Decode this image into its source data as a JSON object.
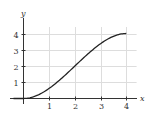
{
  "chart_data": {
    "type": "line",
    "title": "",
    "xlabel": "x",
    "ylabel": "y",
    "xlim": [
      0,
      4
    ],
    "ylim": [
      0,
      4
    ],
    "grid": true,
    "x_ticks": [
      "1",
      "2",
      "3",
      "4"
    ],
    "y_ticks": [
      "1",
      "2",
      "3",
      "4"
    ],
    "series": [
      {
        "name": "f(x)",
        "x": [
          0,
          0.5,
          1,
          1.5,
          2,
          2.5,
          3,
          3.5,
          4
        ],
        "values": [
          0,
          0.17,
          0.63,
          1.27,
          2,
          2.73,
          3.38,
          3.83,
          4
        ]
      }
    ],
    "colors": {
      "curve": "#222222",
      "axis": "#333333",
      "grid": "#dddddd"
    }
  }
}
